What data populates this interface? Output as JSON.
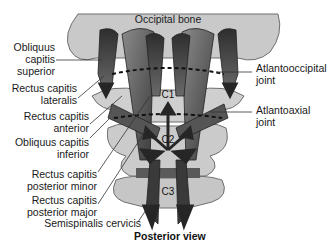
{
  "figure": {
    "caption": "Posterior view",
    "top_label": "Occipital bone",
    "vertebrae": [
      "C1",
      "C2",
      "C3"
    ],
    "left_labels": [
      {
        "line1": "Obliquus",
        "line2": "capitis",
        "line3": "superior"
      },
      {
        "line1": "Rectus capitis",
        "line2": "lateralis"
      },
      {
        "line1": "Rectus capitis",
        "line2": "anterior"
      },
      {
        "line1": "Obliquus capitis",
        "line2": "inferior"
      },
      {
        "line1": "Rectus capitis",
        "line2": "posterior minor"
      },
      {
        "line1": "Rectus capitis",
        "line2": "posterior major"
      },
      {
        "line1": "Semispinalis cervicis"
      }
    ],
    "right_labels": [
      {
        "line1": "Atlantooccipital",
        "line2": "joint"
      },
      {
        "line1": "Atlantoaxial",
        "line2": "joint"
      }
    ],
    "colors": {
      "bone": "#c9c9c9",
      "bone_outline": "#6f6f6f",
      "muscle_dark": "#3a3a3a",
      "muscle_mid": "#6a6a6a",
      "arrow": "#262626",
      "leader": "#333333"
    }
  }
}
